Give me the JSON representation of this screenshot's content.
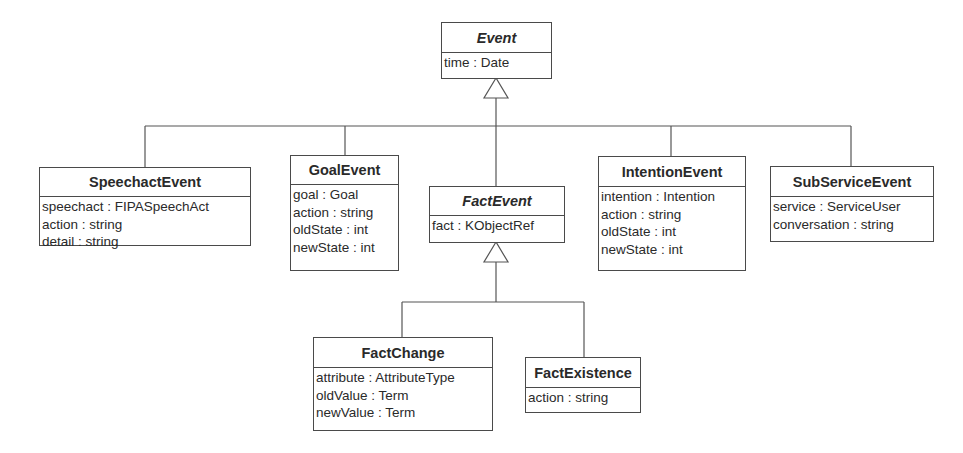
{
  "diagram": {
    "type": "UML class diagram",
    "classes": {
      "event": {
        "name": "Event",
        "abstract": true,
        "attributes": [
          "time : Date"
        ]
      },
      "speechact_event": {
        "name": "SpeechactEvent",
        "abstract": false,
        "attributes": [
          "speechact : FIPASpeechAct",
          "action : string",
          "detail : string"
        ]
      },
      "goal_event": {
        "name": "GoalEvent",
        "abstract": false,
        "attributes": [
          "goal : Goal",
          "action : string",
          "oldState : int",
          "newState : int"
        ]
      },
      "fact_event": {
        "name": "FactEvent",
        "abstract": true,
        "attributes": [
          "fact : KObjectRef"
        ]
      },
      "intention_event": {
        "name": "IntentionEvent",
        "abstract": false,
        "attributes": [
          "intention : Intention",
          "action : string",
          "oldState : int",
          "newState : int"
        ]
      },
      "subservice_event": {
        "name": "SubServiceEvent",
        "abstract": false,
        "attributes": [
          "service : ServiceUser",
          "conversation : string"
        ]
      },
      "fact_change": {
        "name": "FactChange",
        "abstract": false,
        "attributes": [
          "attribute : AttributeType",
          "oldValue : Term",
          "newValue : Term"
        ]
      },
      "fact_existence": {
        "name": "FactExistence",
        "abstract": false,
        "attributes": [
          "action : string"
        ]
      }
    },
    "generalizations": [
      {
        "parent": "Event",
        "children": [
          "SpeechactEvent",
          "GoalEvent",
          "FactEvent",
          "IntentionEvent",
          "SubServiceEvent"
        ]
      },
      {
        "parent": "FactEvent",
        "children": [
          "FactChange",
          "FactExistence"
        ]
      }
    ]
  }
}
